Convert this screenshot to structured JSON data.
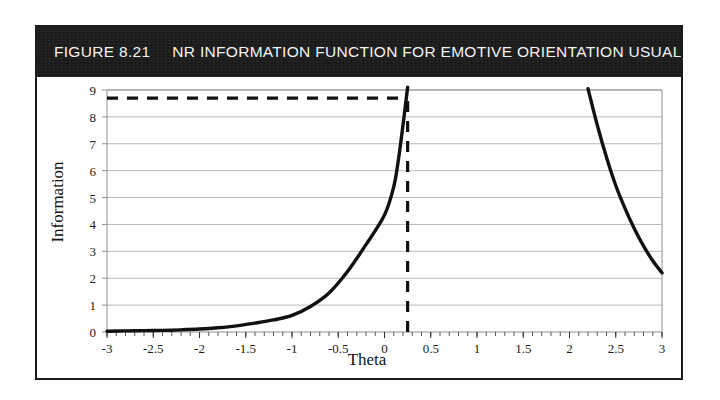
{
  "figure": {
    "label": "FIGURE 8.21",
    "caption": "NR INFORMATION FUNCTION FOR EMOTIVE ORIENTATION USUAL SCALE",
    "banner_bg": "#1a1a1a",
    "banner_fg": "#f2f2f2",
    "frame_color": "#1b1b1b"
  },
  "chart_data": {
    "type": "line",
    "title": "NR INFORMATION FUNCTION FOR EMOTIVE ORIENTATION USUAL SCALE",
    "xlabel": "Theta",
    "ylabel": "Information",
    "xlim": [
      -3,
      3
    ],
    "ylim": [
      0,
      9
    ],
    "grid": "horizontal",
    "legend": "none",
    "line_color": "#111111",
    "gridline_color": "#b9b9b9",
    "xticks": [
      -3,
      -2.5,
      -2,
      -1.5,
      -1,
      -0.5,
      0,
      0.5,
      1,
      1.5,
      2,
      2.5,
      3
    ],
    "xtick_labels": [
      "-3",
      "-2.5",
      "-2",
      "-1.5",
      "-1",
      "-0.5",
      "0",
      "0.5",
      "1",
      "1.5",
      "2",
      "2.5",
      "3"
    ],
    "yticks": [
      0,
      1,
      2,
      3,
      4,
      5,
      6,
      7,
      8,
      9
    ],
    "ytick_labels": [
      "0",
      "1",
      "2",
      "3",
      "4",
      "5",
      "6",
      "7",
      "8",
      "9"
    ],
    "minor_xtick_step": 0.1,
    "series": [
      {
        "name": "information-left-branch",
        "x": [
          -3.0,
          -2.8,
          -2.6,
          -2.4,
          -2.2,
          -2.0,
          -1.8,
          -1.6,
          -1.4,
          -1.2,
          -1.0,
          -0.8,
          -0.6,
          -0.4,
          -0.2,
          0.0,
          0.1,
          0.15,
          0.2,
          0.25
        ],
        "y": [
          0.03,
          0.04,
          0.05,
          0.06,
          0.08,
          0.11,
          0.16,
          0.23,
          0.33,
          0.45,
          0.62,
          0.95,
          1.45,
          2.25,
          3.25,
          4.35,
          5.4,
          6.4,
          7.7,
          9.1
        ]
      },
      {
        "name": "information-right-branch",
        "x": [
          2.2,
          2.3,
          2.4,
          2.5,
          2.6,
          2.7,
          2.8,
          2.9,
          3.0
        ],
        "y": [
          9.05,
          7.7,
          6.5,
          5.45,
          4.6,
          3.85,
          3.2,
          2.65,
          2.2
        ]
      }
    ],
    "annotations": [
      {
        "name": "peak-horizontal-guide",
        "style": "dashed",
        "y": 8.7,
        "x_from": -3.0,
        "x_to": 0.23
      },
      {
        "name": "peak-vertical-guide",
        "style": "dashed",
        "x": 0.25,
        "y_from": 0.0,
        "y_to": 8.7
      }
    ]
  }
}
